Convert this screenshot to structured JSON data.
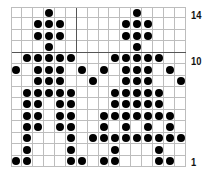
{
  "chart": {
    "title": "",
    "columns": 16,
    "rows": 14,
    "row_labels": [
      {
        "row": 14,
        "text": "14"
      },
      {
        "row": 10,
        "text": "10"
      },
      {
        "row": 1,
        "text": "1"
      }
    ],
    "dots_by_row": {
      "14": [
        4,
        12
      ],
      "13": [
        3,
        4,
        5,
        11,
        12,
        13
      ],
      "12": [
        3,
        4,
        5,
        11,
        12,
        13
      ],
      "11": [
        4,
        12
      ],
      "10": [
        2,
        3,
        4,
        5,
        6,
        10,
        11,
        12,
        13,
        14
      ],
      "9": [
        1,
        3,
        4,
        5,
        7,
        9,
        11,
        12,
        13,
        15
      ],
      "8": [
        3,
        4,
        5,
        8,
        11,
        12,
        13,
        16
      ],
      "7": [
        2,
        3,
        4,
        5,
        6,
        10,
        11,
        12,
        13,
        14
      ],
      "6": [
        2,
        3,
        5,
        6,
        10,
        11,
        12,
        13,
        14
      ],
      "5": [
        2,
        3,
        5,
        6,
        9,
        10,
        11,
        12,
        13,
        14,
        15
      ],
      "4": [
        2,
        3,
        5,
        6,
        9,
        11,
        13,
        15
      ],
      "3": [
        2,
        6,
        8,
        9,
        10,
        11,
        12,
        13,
        14,
        15,
        16
      ],
      "2": [
        2,
        6,
        10,
        14
      ],
      "1": [
        1,
        2,
        6,
        7,
        9,
        10,
        14,
        15
      ]
    },
    "thick_lines": {
      "after_column": 6,
      "below_row": 11
    },
    "colors": {
      "dot": "#000000",
      "grid": "#bdbdbd",
      "thick": "#555555"
    }
  }
}
